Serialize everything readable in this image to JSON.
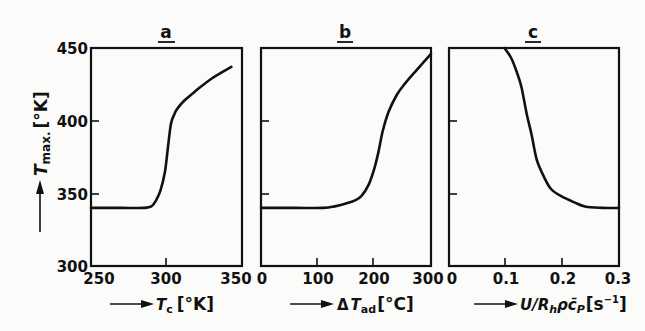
{
  "chart_data": [
    {
      "type": "line",
      "panel": "a",
      "title": "a",
      "xlabel": "T_c [°K]",
      "ylabel": "T_max. [°K]",
      "xlim": [
        250,
        350
      ],
      "ylim": [
        300,
        450
      ],
      "xticks": [
        "250",
        "300",
        "350"
      ],
      "yticks": [
        "300",
        "350",
        "400",
        "450"
      ],
      "grid": false,
      "x": [
        250,
        270,
        285,
        290,
        293,
        296,
        299,
        301,
        303,
        305,
        307,
        312,
        320,
        330,
        343
      ],
      "y": [
        340,
        340,
        340,
        341,
        345,
        352,
        365,
        382,
        398,
        404,
        408,
        414,
        421,
        429,
        437
      ]
    },
    {
      "type": "line",
      "panel": "b",
      "title": "b",
      "xlabel": "ΔT_ad [°C]",
      "ylabel": "",
      "xlim": [
        0,
        300
      ],
      "ylim": [
        300,
        450
      ],
      "xticks": [
        "0",
        "100",
        "200",
        "300"
      ],
      "yticks": [],
      "grid": false,
      "x": [
        0,
        60,
        110,
        130,
        150,
        165,
        177,
        190,
        200,
        207,
        215,
        225,
        240,
        255,
        275,
        300
      ],
      "y": [
        340,
        340,
        340,
        341,
        343,
        345,
        348,
        356,
        367,
        378,
        393,
        406,
        418,
        426,
        435,
        446
      ]
    },
    {
      "type": "line",
      "panel": "c",
      "title": "c",
      "xlabel": "U/R_h ρ c̄_P [s^-1]",
      "ylabel": "",
      "xlim": [
        0,
        0.3
      ],
      "ylim": [
        300,
        450
      ],
      "xticks": [
        "0",
        "0.1",
        "0.2",
        "0.3"
      ],
      "yticks": [],
      "grid": false,
      "x": [
        0.098,
        0.11,
        0.12,
        0.128,
        0.137,
        0.146,
        0.155,
        0.168,
        0.18,
        0.198,
        0.22,
        0.24,
        0.27,
        0.3
      ],
      "y": [
        450,
        443,
        433,
        423,
        405,
        390,
        373,
        361,
        353,
        348,
        344,
        341,
        340,
        340
      ]
    }
  ],
  "panels": {
    "a": {
      "title": "a",
      "xlabel_main": "T",
      "xlabel_sub": "c",
      "xlabel_unit": "[°K]",
      "xticks": [
        "250",
        "300",
        "350"
      ]
    },
    "b": {
      "title": "b",
      "xlabel_pre": "Δ",
      "xlabel_main": "T",
      "xlabel_sub": "ad",
      "xlabel_unit": "[°C]",
      "xticks": [
        "0",
        "100",
        "200",
        "300"
      ]
    },
    "c": {
      "title": "c",
      "xlabel_main": "U/R",
      "xlabel_sub": "h",
      "xlabel_mid": "ρc̄",
      "xlabel_sub2": "P",
      "xlabel_unit": "[s",
      "xlabel_sup": "−1",
      "xlabel_end": "]",
      "xticks": [
        "0",
        "0.1",
        "0.2",
        "0.3"
      ]
    }
  },
  "yaxis": {
    "label_main": "T",
    "label_sub": "max.",
    "label_unit": "[°K]",
    "ticks": [
      "300",
      "350",
      "400",
      "450"
    ]
  }
}
